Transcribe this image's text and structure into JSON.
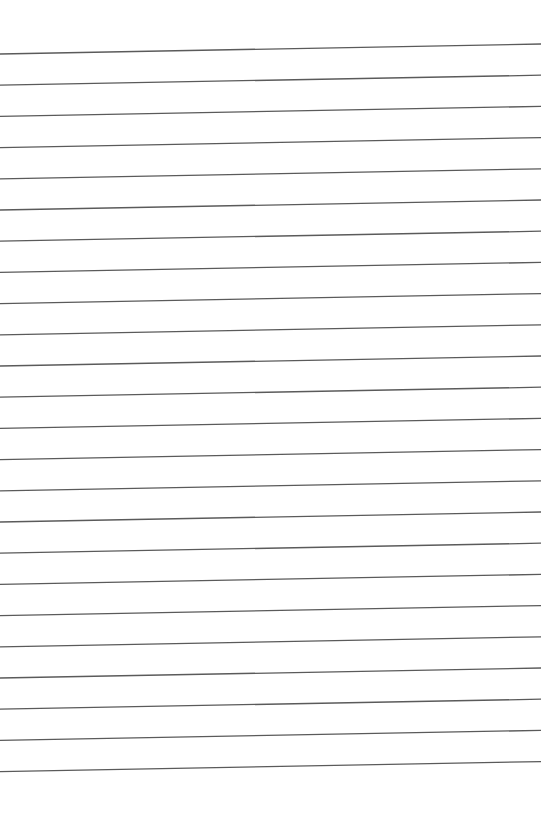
{
  "page": {
    "type": "blank lined paper",
    "background": "#ffffff",
    "line_color": "#5a5a5a",
    "line_count": 24,
    "first_line_left_y": 54,
    "first_line_right_y": 44,
    "line_spacing": 31.2,
    "line_width": 1.3
  }
}
